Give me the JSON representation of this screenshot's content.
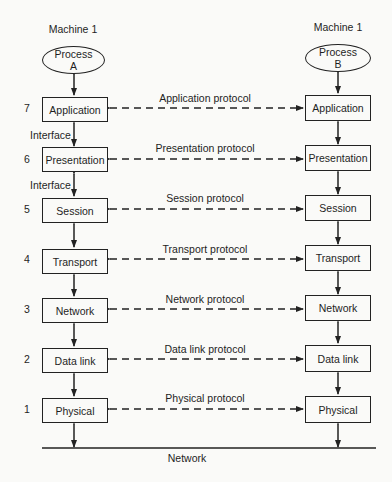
{
  "diagram": {
    "left": {
      "machine_label": "Machine 1",
      "process_line1": "Process",
      "process_line2": "A"
    },
    "right": {
      "machine_label": "Machine 1",
      "process_line1": "Process",
      "process_line2": "B"
    },
    "layers": [
      {
        "number": "7",
        "name": "Application",
        "protocol": "Application protocol"
      },
      {
        "number": "6",
        "name": "Presentation",
        "protocol": "Presentation protocol"
      },
      {
        "number": "5",
        "name": "Session",
        "protocol": "Session protocol"
      },
      {
        "number": "4",
        "name": "Transport",
        "protocol": "Transport protocol"
      },
      {
        "number": "3",
        "name": "Network",
        "protocol": "Network protocol"
      },
      {
        "number": "2",
        "name": "Data link",
        "protocol": "Data link protocol"
      },
      {
        "number": "1",
        "name": "Physical",
        "protocol": "Physical protocol"
      }
    ],
    "interface_labels": [
      "Interface",
      "Interface"
    ],
    "network_label": "Network",
    "colors": {
      "ink": "#222222",
      "paper": "#fafaf8"
    }
  }
}
